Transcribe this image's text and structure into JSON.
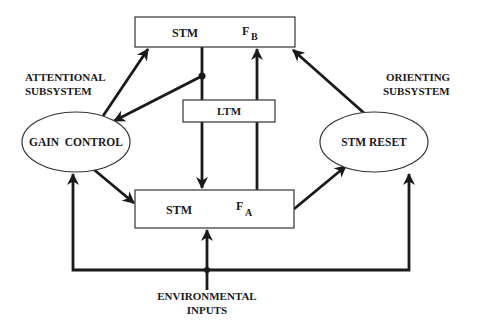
{
  "diagram": {
    "type": "block-diagram",
    "nodes": {
      "fb": {
        "label": "STM",
        "sublabel_main": "F",
        "sublabel_sub": "B"
      },
      "ltm": {
        "label": "LTM"
      },
      "fa": {
        "label": "STM",
        "sublabel_main": "F",
        "sublabel_sub": "A"
      },
      "gain_control": {
        "label": "GAIN  CONTROL"
      },
      "stm_reset": {
        "label": "STM RESET"
      }
    },
    "annotations": {
      "attentional": [
        "ATTENTIONAL",
        "SUBSYSTEM"
      ],
      "orienting": [
        "ORIENTING",
        "SUBSYSTEM"
      ],
      "inputs": [
        "ENVIRONMENTAL",
        "INPUTS"
      ]
    },
    "edges": [
      {
        "from": "gain_control",
        "to": "fb"
      },
      {
        "from": "fb",
        "to": "gain_control",
        "via": "junction"
      },
      {
        "from": "fb",
        "to": "fa",
        "via": "ltm"
      },
      {
        "from": "fa",
        "to": "fb",
        "via": "ltm"
      },
      {
        "from": "gain_control",
        "to": "fa"
      },
      {
        "from": "fa",
        "to": "stm_reset"
      },
      {
        "from": "stm_reset",
        "to": "fb"
      },
      {
        "from": "environmental_inputs",
        "to": "fa"
      },
      {
        "from": "environmental_inputs",
        "to": "gain_control"
      },
      {
        "from": "environmental_inputs",
        "to": "stm_reset"
      }
    ],
    "colors": {
      "line": "#1a1a1a",
      "box_border": "#333333",
      "background": "#ffffff"
    }
  }
}
